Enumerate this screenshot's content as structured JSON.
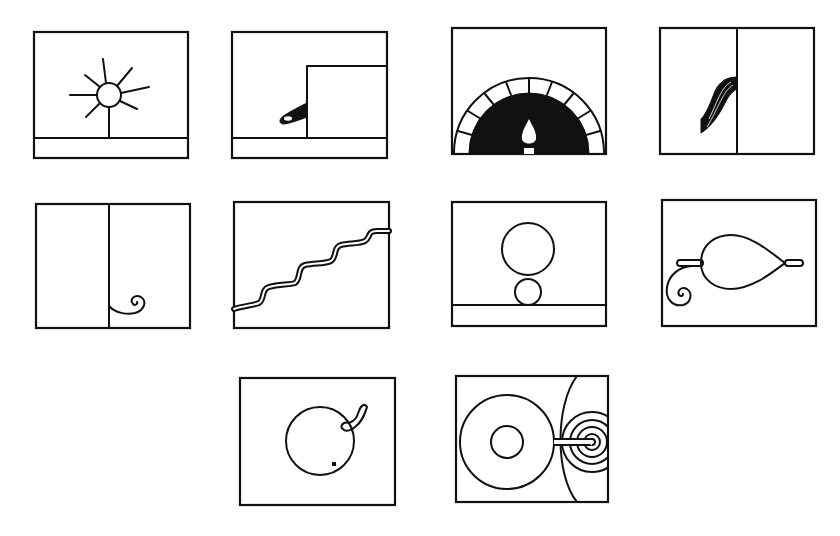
{
  "diagram": {
    "type": "pictogram-grid",
    "layout": {
      "rows": 3,
      "columns_per_row": [
        4,
        4,
        2
      ]
    },
    "stroke_color": "#111111",
    "background_color": "#ffffff",
    "panels": [
      {
        "id": 1,
        "row": 1,
        "col": 1,
        "label": "sun-over-ground",
        "description": "Sun with rays on a vertical stem above a ground band"
      },
      {
        "id": 2,
        "row": 1,
        "col": 2,
        "label": "sprout-at-step",
        "description": "Curved dark shoot growing at the base of a raised step, ground band below"
      },
      {
        "id": 3,
        "row": 1,
        "col": 3,
        "label": "brick-oven-flame",
        "description": "Semicircular brick arch with dark interior and a teardrop flame"
      },
      {
        "id": 4,
        "row": 1,
        "col": 4,
        "label": "brush-stroke-divider",
        "description": "Panel split by a vertical line with a dark brush stroke hanging from it"
      },
      {
        "id": 5,
        "row": 2,
        "col": 1,
        "label": "divider-with-curl",
        "description": "Panel split by a vertical line ending in a small spiral curl"
      },
      {
        "id": 6,
        "row": 2,
        "col": 2,
        "label": "wavy-staircase",
        "description": "Double-line wavy staircase rising left to right"
      },
      {
        "id": 7,
        "row": 2,
        "col": 3,
        "label": "stacked-circles",
        "description": "Large circle resting on a small circle above a ground band"
      },
      {
        "id": 8,
        "row": 2,
        "col": 4,
        "label": "teardrop-on-rod",
        "description": "Teardrop shape on a horizontal rod with a spiral curl at left"
      },
      {
        "id": 9,
        "row": 3,
        "col": 1,
        "label": "fruit-with-stem",
        "description": "Circle with a short curved stem and a small dot inside"
      },
      {
        "id": 10,
        "row": 3,
        "col": 2,
        "label": "rings-and-spiral",
        "description": "Concentric rings linked by a rod to a spiral target beyond an arc"
      }
    ]
  }
}
